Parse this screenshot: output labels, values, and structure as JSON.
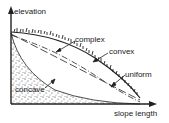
{
  "diagram": {
    "axes": {
      "y_label": "elevation",
      "x_label": "slope length"
    },
    "profiles": [
      {
        "name": "complex",
        "label": "complex",
        "line_style": "dash-dot"
      },
      {
        "name": "convex",
        "label": "convex",
        "line_style": "vegetated-surface"
      },
      {
        "name": "uniform",
        "label": "uniform",
        "line_style": "long-dash"
      },
      {
        "name": "concave",
        "label": "concave",
        "line_style": "stippled-fill"
      }
    ],
    "colors": {
      "ink": "#222222",
      "background": "#ffffff"
    }
  }
}
